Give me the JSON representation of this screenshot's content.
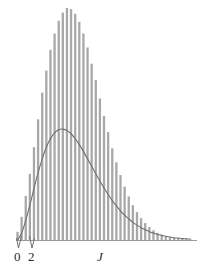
{
  "figure": {
    "background_color": "#ffffff",
    "width": 199,
    "height": 273
  },
  "axis": {
    "baseline_color": "#9a9a9a",
    "x_title": "J",
    "tick_labels": [
      "0",
      "2"
    ],
    "tick_label_color": "#2b2b2b",
    "leader_line_color": "#6f6f6f"
  },
  "chart_data": {
    "type": "bar",
    "title": "",
    "subtitle": "",
    "xlabel": "J",
    "ylabel": "",
    "grid": false,
    "legend": null,
    "bar_color": "#a8a8a8",
    "curve_color": "#6f6f6f",
    "xlim": [
      0,
      43
    ],
    "ylim": [
      0,
      1.0
    ],
    "x_tick_values": [
      0,
      2
    ],
    "x_tick_labels": [
      "0",
      "2"
    ],
    "categories": [
      0,
      1,
      2,
      3,
      4,
      5,
      6,
      7,
      8,
      9,
      10,
      11,
      12,
      13,
      14,
      15,
      16,
      17,
      18,
      19,
      20,
      21,
      22,
      23,
      24,
      25,
      26,
      27,
      28,
      29,
      30,
      31,
      32,
      33,
      34,
      35,
      36,
      37,
      38,
      39,
      40,
      41,
      42
    ],
    "values": [
      0.035,
      0.1,
      0.19,
      0.285,
      0.4,
      0.52,
      0.635,
      0.73,
      0.82,
      0.89,
      0.945,
      0.98,
      1.0,
      0.995,
      0.975,
      0.94,
      0.89,
      0.83,
      0.76,
      0.69,
      0.61,
      0.535,
      0.465,
      0.395,
      0.335,
      0.28,
      0.23,
      0.188,
      0.15,
      0.12,
      0.094,
      0.073,
      0.056,
      0.042,
      0.031,
      0.023,
      0.017,
      0.012,
      0.009,
      0.006,
      0.004,
      0.003,
      0.002
    ],
    "series": [
      {
        "name": "rotational-level-population",
        "type": "bar",
        "values": [
          0.035,
          0.1,
          0.19,
          0.285,
          0.4,
          0.52,
          0.635,
          0.73,
          0.82,
          0.89,
          0.945,
          0.98,
          1.0,
          0.995,
          0.975,
          0.94,
          0.89,
          0.83,
          0.76,
          0.69,
          0.61,
          0.535,
          0.465,
          0.395,
          0.335,
          0.28,
          0.23,
          0.188,
          0.15,
          0.12,
          0.094,
          0.073,
          0.056,
          0.042,
          0.031,
          0.023,
          0.017,
          0.012,
          0.009,
          0.006,
          0.004,
          0.003,
          0.002
        ]
      },
      {
        "name": "envelope-curve",
        "type": "line",
        "x": [
          0,
          1,
          2,
          3,
          4,
          5,
          6,
          7,
          8,
          9,
          10,
          11,
          12,
          13,
          14,
          15,
          16,
          17,
          18,
          19,
          20,
          21,
          22,
          23,
          24,
          25,
          26,
          27,
          28,
          29,
          30,
          31,
          32,
          33,
          34,
          35,
          36,
          37,
          38,
          39,
          40,
          41,
          42
        ],
        "values": [
          0.0,
          0.03,
          0.085,
          0.15,
          0.222,
          0.29,
          0.35,
          0.4,
          0.437,
          0.462,
          0.475,
          0.478,
          0.472,
          0.458,
          0.437,
          0.411,
          0.382,
          0.35,
          0.318,
          0.286,
          0.254,
          0.224,
          0.196,
          0.17,
          0.147,
          0.126,
          0.107,
          0.091,
          0.076,
          0.064,
          0.053,
          0.044,
          0.036,
          0.03,
          0.024,
          0.02,
          0.016,
          0.013,
          0.01,
          0.008,
          0.006,
          0.005,
          0.004
        ]
      }
    ]
  }
}
